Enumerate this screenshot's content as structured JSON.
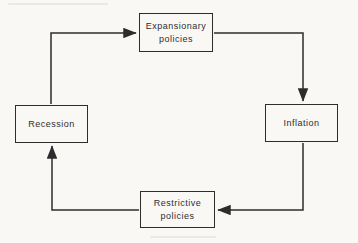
{
  "diagram": {
    "type": "cycle-flow-diagram",
    "nodes": [
      {
        "id": "expansionary",
        "label": "Expansionary\npolicies"
      },
      {
        "id": "inflation",
        "label": "Inflation"
      },
      {
        "id": "restrictive",
        "label": "Restrictive\npolicies"
      },
      {
        "id": "recession",
        "label": "Recession"
      }
    ],
    "edges": [
      {
        "from": "recession",
        "to": "expansionary"
      },
      {
        "from": "expansionary",
        "to": "inflation"
      },
      {
        "from": "inflation",
        "to": "restrictive"
      },
      {
        "from": "restrictive",
        "to": "recession"
      }
    ]
  },
  "colors": {
    "background": "#f9f8f5",
    "line": "#2d2d2d",
    "text": "#2e2e2e"
  }
}
